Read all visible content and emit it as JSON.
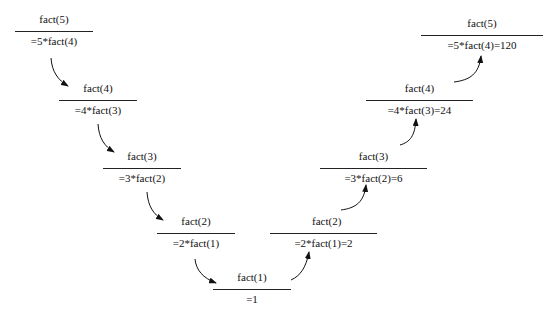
{
  "diagram": {
    "type": "recursion-trace",
    "descent": [
      {
        "call": "fact(5)",
        "expr": "=5*fact(4)"
      },
      {
        "call": "fact(4)",
        "expr": "=4*fact(3)"
      },
      {
        "call": "fact(3)",
        "expr": "=3*fact(2)"
      },
      {
        "call": "fact(2)",
        "expr": "=2*fact(1)"
      }
    ],
    "base": {
      "call": "fact(1)",
      "expr": "=1"
    },
    "ascent": [
      {
        "call": "fact(2)",
        "expr": "=2*fact(1)=2"
      },
      {
        "call": "fact(3)",
        "expr": "=3*fact(2)=6"
      },
      {
        "call": "fact(4)",
        "expr": "=4*fact(3)=24"
      },
      {
        "call": "fact(5)",
        "expr": "=5*fact(4)=120"
      }
    ]
  }
}
